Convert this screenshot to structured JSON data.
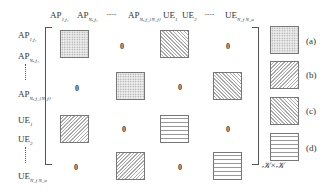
{
  "columns": [
    {
      "base": "AP",
      "sub": "1,f₁"
    },
    {
      "base": "AP",
      "sub": "Nₐ,f₁"
    },
    {
      "base": "······",
      "sub": ""
    },
    {
      "base": "AP",
      "sub": "Nₐ,f_{N_f}"
    },
    {
      "base": "UE",
      "sub": "1"
    },
    {
      "base": "UE",
      "sub": "2"
    },
    {
      "base": "······",
      "sub": ""
    },
    {
      "base": "UE",
      "sub": "N_f N_u"
    }
  ],
  "rows": [
    {
      "base": "AP",
      "sub": "1,f₁"
    },
    {
      "base": "AP",
      "sub": "Nₐ,f₁"
    },
    {
      "base": "AP",
      "sub": "Nₐ,f_{N_f}"
    },
    {
      "base": "UE",
      "sub": "1"
    },
    {
      "base": "UE",
      "sub": "2"
    },
    {
      "base": "UE",
      "sub": "N_f N_u"
    }
  ],
  "zero_label": "0",
  "legend": [
    {
      "pattern": "dotted",
      "label": "(a)"
    },
    {
      "pattern": "diagonal-forward",
      "label": "(b)"
    },
    {
      "pattern": "diagonal-backward",
      "label": "(c)"
    },
    {
      "pattern": "horizontal-lines",
      "label": "(d)"
    }
  ],
  "dimension_label": "𝒦×𝒦"
}
